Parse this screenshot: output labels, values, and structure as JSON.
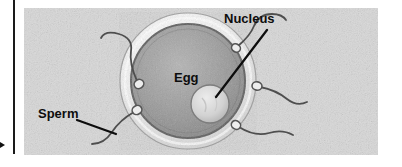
{
  "figure": {
    "style": "grayscale pencil illustration",
    "labels": {
      "nucleus": "Nucleus",
      "egg": "Egg",
      "sperm": "Sperm"
    },
    "colors": {
      "background": "#ffffff",
      "paper_texture": "#d8d8d8",
      "zona_pellucida": "#f2f2f2",
      "cytoplasm": "#9a9a9a",
      "cytoplasm_rim": "#6f6f6f",
      "nucleus": "#d5d5d5",
      "sperm_ink": "#4a4a4a",
      "leader_line": "#0d0d0d",
      "margin_rule": "#1a1a1a",
      "edge_arrow": "#111111"
    },
    "structures": [
      {
        "name": "zona-pellucida",
        "description": "pale outer ring around the egg"
      },
      {
        "name": "cytoplasm",
        "description": "large dark gray sphere forming body of egg"
      },
      {
        "name": "nucleus",
        "description": "small pale round body inside the egg, lower right of centre"
      }
    ],
    "sperm_count": 5,
    "sperm_positions": [
      "top-left of egg",
      "top-right of egg",
      "right of egg",
      "bottom-right of egg",
      "bottom-left of egg"
    ],
    "leader_lines": [
      {
        "from": "Nucleus label",
        "to": "nucleus"
      },
      {
        "from": "Sperm label",
        "to": "bottom-left sperm tail"
      }
    ]
  }
}
